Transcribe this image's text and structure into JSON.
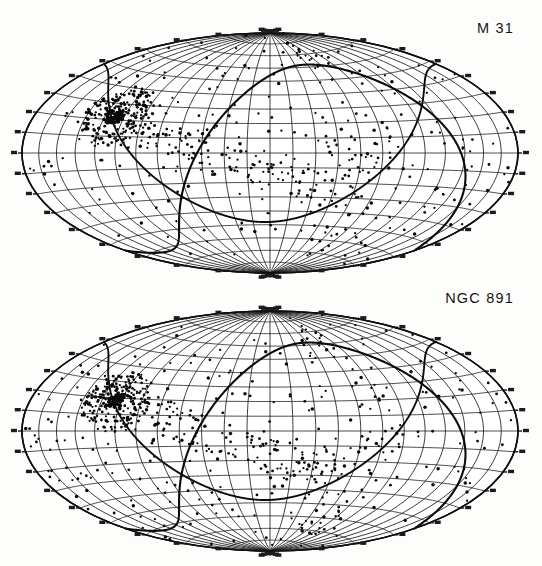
{
  "figure": {
    "background_color": "#fdfdfb",
    "ink_color": "#111111",
    "panel_count": 2
  },
  "panels": [
    {
      "id": "m31",
      "label": "M 31",
      "projection": "aitoff-hammer",
      "center": {
        "x": 270,
        "y": 153
      },
      "radius": {
        "x": 248,
        "y": 120
      }
    },
    {
      "id": "ngc891",
      "label": "NGC 891",
      "projection": "aitoff-hammer",
      "center": {
        "x": 270,
        "y": 155
      },
      "radius": {
        "x": 248,
        "y": 120
      }
    }
  ],
  "chart_data": {
    "type": "scatter",
    "title": "",
    "subtitle": "",
    "xlabel": "",
    "ylabel": "",
    "projection": "aitoff-hammer-equal-area",
    "coordinate_system": "galactic",
    "xlim": [
      -180,
      180
    ],
    "ylim": [
      -90,
      90
    ],
    "grid": true,
    "legend_position": "none",
    "graticule": {
      "meridian_step_deg": 15,
      "parallel_step_deg": 10,
      "meridian_range": [
        -180,
        180
      ],
      "parallel_range": [
        -80,
        80
      ]
    },
    "annotations": [
      {
        "text": "M 31",
        "panel": "m31",
        "position": "top-right"
      },
      {
        "text": "NGC 891",
        "panel": "ngc891",
        "position": "top-right"
      }
    ],
    "overlays": [
      {
        "name": "great-circle-primary",
        "inclination_deg": 62,
        "node_deg": -48,
        "stroke_width": 2.1
      },
      {
        "name": "great-circle-secondary",
        "inclination_deg": 48,
        "node_deg": 86,
        "stroke_width": 1.9
      }
    ],
    "series": [
      {
        "name": "M 31 sky distribution",
        "panel": "m31",
        "marker": "dot",
        "color": "#090909",
        "point_count": 612,
        "concentration": {
          "name": "supergalactic-plane-cluster",
          "center_lonlat": [
            -112,
            22
          ],
          "description": "dense clump of points on the left-hand side"
        }
      },
      {
        "name": "NGC 891 sky distribution",
        "panel": "ngc891",
        "marker": "dot",
        "color": "#090909",
        "point_count": 655,
        "concentration": {
          "name": "supergalactic-plane-cluster",
          "center_lonlat": [
            -110,
            18
          ],
          "description": "dense clump of points on the left-hand side"
        }
      }
    ]
  }
}
